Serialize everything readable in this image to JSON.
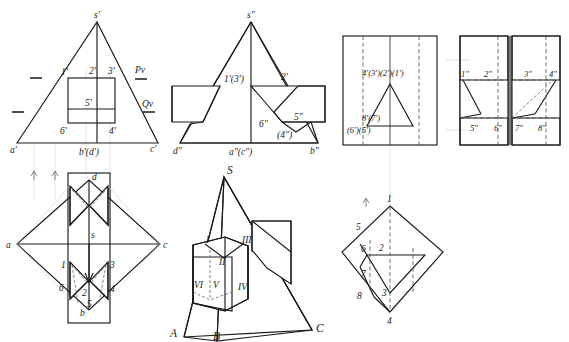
{
  "sheet": {
    "title": "Descriptive geometry — orthographic projections of a pyramid with rectangular notch",
    "background": "#ffffff",
    "line_color": "#1a1a1a",
    "hidden_line_color": "#555555",
    "width": 569,
    "height": 342
  },
  "panel_front": {
    "name": "front-view",
    "apex": "s'",
    "base_left": "a'",
    "base_mid": "b'(d')",
    "base_right": "c'",
    "notch_top_left": "1'",
    "notch_top_mid": "2'",
    "notch_top_right": "3'",
    "notch_center": "5'",
    "notch_bottom_left": "6'",
    "notch_bottom_right": "4'",
    "trace_upper": "Pv",
    "trace_lower": "Qv"
  },
  "panel_side": {
    "name": "side-view",
    "apex": "s\"",
    "base_left": "d\"",
    "base_mid": "a\"(c\")",
    "base_right": "b\"",
    "edge_label_left": "1'(3')",
    "edge_label_right": "2'",
    "face_label": "5\"",
    "notch_low_left": "6\"",
    "notch_low_mid": "(4\")"
  },
  "panel_aux_left": {
    "name": "auxiliary-view-left",
    "top_label": "4'(3')(2')(1')",
    "mid_label": "8'(7')",
    "bottom_label": "(6')(5')"
  },
  "panel_aux_right": {
    "name": "auxiliary-view-right",
    "top_1": "1\"",
    "top_2": "2\"",
    "top_3": "3\"",
    "top_4": "4\"",
    "bot_5": "5\"",
    "bot_6": "6\"",
    "bot_7": "7\"",
    "bot_8": "8\""
  },
  "panel_top": {
    "name": "top-view",
    "left": "a",
    "right": "c",
    "top": "d",
    "bottom": "b",
    "center": "s",
    "n1": "1",
    "n2": "2",
    "n3": "3",
    "n4": "4",
    "n5": "5",
    "n6": "6"
  },
  "panel_pictorial": {
    "name": "pictorial-view",
    "apex": "S",
    "corner_a": "A",
    "corner_b": "B",
    "corner_c": "C",
    "face_1": "I",
    "face_2": "II",
    "face_3": "III",
    "face_4": "IV",
    "face_5": "V",
    "face_6": "VI"
  },
  "panel_diamond": {
    "name": "diamond-view",
    "p1": "1",
    "p2": "2",
    "p3": "3",
    "p4": "4",
    "p5": "5",
    "p6": "6",
    "p7": "7",
    "p8": "8"
  }
}
